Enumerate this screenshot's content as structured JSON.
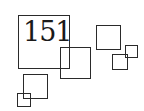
{
  "page_number": "151",
  "colors": {
    "stroke": "#2a2a2a",
    "text": "#1a1a1a",
    "background": "#ffffff"
  },
  "squares": [
    {
      "id": "main",
      "x": 18,
      "y": 15,
      "w": 52,
      "h": 54
    },
    {
      "id": "center",
      "x": 60,
      "y": 47,
      "w": 31,
      "h": 32
    },
    {
      "id": "upper-right",
      "x": 96,
      "y": 25,
      "w": 25,
      "h": 25
    },
    {
      "id": "small-right-lower",
      "x": 112,
      "y": 54,
      "w": 16,
      "h": 16
    },
    {
      "id": "small-right-upper",
      "x": 125,
      "y": 45,
      "w": 13,
      "h": 13
    },
    {
      "id": "lower-left",
      "x": 23,
      "y": 74,
      "w": 25,
      "h": 25
    },
    {
      "id": "tiny-lower-left",
      "x": 17,
      "y": 93,
      "w": 14,
      "h": 14
    }
  ]
}
